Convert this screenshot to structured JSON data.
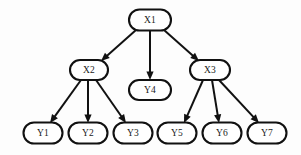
{
  "diagram": {
    "title": "",
    "type": "directed-tree",
    "background_color": "#fdfdfd",
    "node_fill_color": "#ffffff",
    "node_stroke_color": "#111111",
    "edge_color": "#111111",
    "nodes": [
      {
        "id": "X1",
        "label": "X1",
        "cx": 150,
        "cy": 20,
        "rx": 21,
        "ry": 10.5,
        "level": 0
      },
      {
        "id": "X2",
        "label": "X2",
        "cx": 89,
        "cy": 70,
        "rx": 19,
        "ry": 10.0,
        "level": 1
      },
      {
        "id": "Y4",
        "label": "Y4",
        "cx": 150,
        "cy": 90,
        "rx": 21,
        "ry": 10.0,
        "level": 1
      },
      {
        "id": "X3",
        "label": "X3",
        "cx": 210,
        "cy": 70,
        "rx": 20,
        "ry": 10.0,
        "level": 1
      },
      {
        "id": "Y1",
        "label": "Y1",
        "cx": 43,
        "cy": 133,
        "rx": 19.5,
        "ry": 10.5,
        "level": 2
      },
      {
        "id": "Y2",
        "label": "Y2",
        "cx": 88,
        "cy": 133,
        "rx": 19.5,
        "ry": 10.5,
        "level": 2
      },
      {
        "id": "Y3",
        "label": "Y3",
        "cx": 133,
        "cy": 133,
        "rx": 19.5,
        "ry": 10.5,
        "level": 2
      },
      {
        "id": "Y5",
        "label": "Y5",
        "cx": 177,
        "cy": 133,
        "rx": 19.5,
        "ry": 10.5,
        "level": 2
      },
      {
        "id": "Y6",
        "label": "Y6",
        "cx": 222,
        "cy": 133,
        "rx": 19.5,
        "ry": 10.5,
        "level": 2
      },
      {
        "id": "Y7",
        "label": "Y7",
        "cx": 267,
        "cy": 133,
        "rx": 19.5,
        "ry": 10.5,
        "level": 2
      }
    ],
    "edges": [
      {
        "from": "X1",
        "to": "X2",
        "x1": 136,
        "y1": 30,
        "x2": 101,
        "y2": 61
      },
      {
        "from": "X1",
        "to": "Y4",
        "x1": 150,
        "y1": 31,
        "x2": 150,
        "y2": 80
      },
      {
        "from": "X1",
        "to": "X3",
        "x1": 164,
        "y1": 30,
        "x2": 199,
        "y2": 61
      },
      {
        "from": "X2",
        "to": "Y1",
        "x1": 81,
        "y1": 80,
        "x2": 50,
        "y2": 123
      },
      {
        "from": "X2",
        "to": "Y2",
        "x1": 88,
        "y1": 80,
        "x2": 88,
        "y2": 123
      },
      {
        "from": "X2",
        "to": "Y3",
        "x1": 96,
        "y1": 80,
        "x2": 126,
        "y2": 123
      },
      {
        "from": "X3",
        "to": "Y5",
        "x1": 203,
        "y1": 80,
        "x2": 184,
        "y2": 123
      },
      {
        "from": "X3",
        "to": "Y6",
        "x1": 212,
        "y1": 80,
        "x2": 219,
        "y2": 123
      },
      {
        "from": "X3",
        "to": "Y7",
        "x1": 219,
        "y1": 80,
        "x2": 259,
        "y2": 123
      }
    ]
  }
}
